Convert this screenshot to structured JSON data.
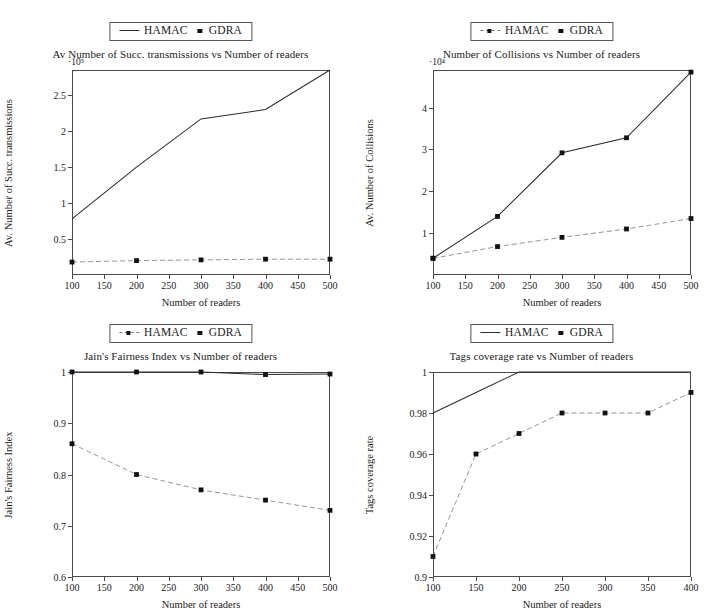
{
  "figure": {
    "panels": [
      {
        "id": "succ-transmissions",
        "title": "Av Number of Succ. transmissions vs Number of readers",
        "xlabel": "Number of readers",
        "ylabel": "Av. Number of Succ. transmissions",
        "exponent": "·10⁵",
        "legend": [
          {
            "label": "HAMAC",
            "marker": "line"
          },
          {
            "label": "GDRA",
            "marker": "square"
          }
        ],
        "yticks": [
          "0.5",
          "1",
          "1.5",
          "2",
          "2.5"
        ],
        "xticks": [
          "100",
          "150",
          "200",
          "250",
          "300",
          "350",
          "400",
          "450",
          "500"
        ]
      },
      {
        "id": "collisions",
        "title": "Number of Collisions vs Number of readers",
        "xlabel": "Number of readers",
        "ylabel": "Av. Number of Collisions",
        "exponent": "·10⁴",
        "legend": [
          {
            "label": "HAMAC",
            "marker": "marker"
          },
          {
            "label": "GDRA",
            "marker": "square"
          }
        ],
        "yticks": [
          "1",
          "2",
          "3",
          "4"
        ],
        "xticks": [
          "100",
          "150",
          "200",
          "250",
          "300",
          "350",
          "400",
          "450",
          "500"
        ]
      },
      {
        "id": "jains-fairness",
        "title": "Jain's Fairness Index vs Number of readers",
        "xlabel": "Number of readers",
        "ylabel": "Jain's Fairness Index",
        "exponent": "",
        "legend": [
          {
            "label": "HAMAC",
            "marker": "marker"
          },
          {
            "label": "GDRA",
            "marker": "square"
          }
        ],
        "yticks": [
          "0.6",
          "0.7",
          "0.8",
          "0.9",
          "1"
        ],
        "xticks": [
          "100",
          "150",
          "200",
          "250",
          "300",
          "350",
          "400",
          "450",
          "500"
        ]
      },
      {
        "id": "tags-coverage",
        "title": "Tags coverage rate vs Number of readers",
        "xlabel": "Number of readers",
        "ylabel": "Tags coverage rate",
        "exponent": "",
        "legend": [
          {
            "label": "HAMAC",
            "marker": "line"
          },
          {
            "label": "GDRA",
            "marker": "square"
          }
        ],
        "yticks": [
          "0.9",
          "0.92",
          "0.94",
          "0.96",
          "0.98",
          "1"
        ],
        "xticks": [
          "100",
          "150",
          "200",
          "250",
          "300",
          "350",
          "400"
        ]
      }
    ]
  },
  "chart_data": [
    {
      "type": "line",
      "title": "Av Number of Succ. transmissions vs Number of readers",
      "xlabel": "Number of readers",
      "ylabel": "Av. Number of Succ. transmissions",
      "y_exponent": 100000,
      "y_exponent_label": "·10⁵",
      "x": [
        100,
        200,
        300,
        400,
        500
      ],
      "xlim": [
        100,
        500
      ],
      "ylim": [
        0,
        2.85
      ],
      "xticks": [
        100,
        150,
        200,
        250,
        300,
        350,
        400,
        450,
        500
      ],
      "yticks": [
        0.5,
        1,
        1.5,
        2,
        2.5
      ],
      "grid": false,
      "legend_position": "above-top-center",
      "series": [
        {
          "name": "HAMAC",
          "style": "solid-line",
          "values": [
            0.78,
            1.5,
            2.17,
            2.3,
            2.85
          ]
        },
        {
          "name": "GDRA",
          "style": "dashed-markers",
          "values": [
            0.18,
            0.2,
            0.21,
            0.22,
            0.22
          ]
        }
      ]
    },
    {
      "type": "line",
      "title": "Number of Collisions vs Number of readers",
      "xlabel": "Number of readers",
      "ylabel": "Av. Number of Collisions",
      "y_exponent": 10000,
      "y_exponent_label": "·10⁴",
      "x": [
        100,
        200,
        300,
        400,
        500
      ],
      "xlim": [
        100,
        500
      ],
      "ylim": [
        0,
        4.9
      ],
      "xticks": [
        100,
        150,
        200,
        250,
        300,
        350,
        400,
        450,
        500
      ],
      "yticks": [
        1,
        2,
        3,
        4
      ],
      "grid": false,
      "legend_position": "above-top-center",
      "series": [
        {
          "name": "HAMAC",
          "style": "solid-markers",
          "values": [
            0.4,
            1.4,
            2.92,
            3.28,
            4.85
          ]
        },
        {
          "name": "GDRA",
          "style": "dashed-markers",
          "values": [
            0.4,
            0.68,
            0.9,
            1.1,
            1.35
          ]
        }
      ]
    },
    {
      "type": "line",
      "title": "Jain's Fairness Index vs Number of readers",
      "xlabel": "Number of readers",
      "ylabel": "Jain's Fairness Index",
      "x": [
        100,
        200,
        300,
        400,
        500
      ],
      "xlim": [
        100,
        500
      ],
      "ylim": [
        0.6,
        1.0
      ],
      "xticks": [
        100,
        150,
        200,
        250,
        300,
        350,
        400,
        450,
        500
      ],
      "yticks": [
        0.6,
        0.7,
        0.8,
        0.9,
        1.0
      ],
      "grid": false,
      "legend_position": "above-top-center",
      "series": [
        {
          "name": "HAMAC",
          "style": "solid-markers",
          "values": [
            1.0,
            1.0,
            1.0,
            0.995,
            0.996
          ]
        },
        {
          "name": "GDRA",
          "style": "dashed-markers",
          "values": [
            0.86,
            0.8,
            0.77,
            0.75,
            0.73
          ]
        }
      ]
    },
    {
      "type": "line",
      "title": "Tags coverage rate vs Number of readers",
      "xlabel": "Number of readers",
      "ylabel": "Tags coverage rate",
      "x": [
        100,
        150,
        200,
        250,
        300,
        350,
        400
      ],
      "xlim": [
        100,
        400
      ],
      "ylim": [
        0.9,
        1.0
      ],
      "xticks": [
        100,
        150,
        200,
        250,
        300,
        350,
        400
      ],
      "yticks": [
        0.9,
        0.92,
        0.94,
        0.96,
        0.98,
        1.0
      ],
      "grid": false,
      "legend_position": "above-top-center",
      "series": [
        {
          "name": "HAMAC",
          "style": "solid-line",
          "values": [
            0.98,
            0.99,
            1.0,
            1.0,
            1.0,
            1.0,
            1.0
          ]
        },
        {
          "name": "GDRA",
          "style": "dashed-markers",
          "values": [
            0.91,
            0.96,
            0.97,
            0.98,
            0.98,
            0.98,
            0.99
          ]
        }
      ]
    }
  ]
}
